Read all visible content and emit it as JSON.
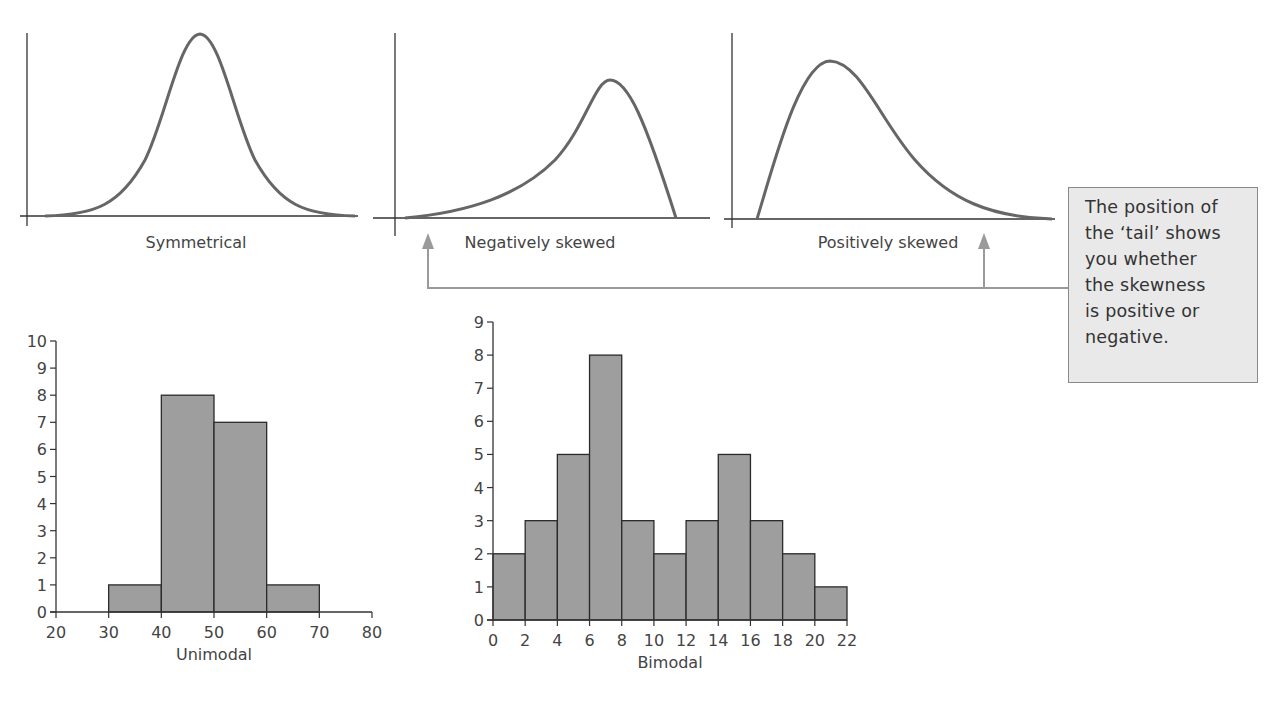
{
  "callout": {
    "lines": [
      "The position of",
      "the ‘tail’ shows",
      "you whether",
      "the skewness",
      "is positive or",
      "negative."
    ],
    "fill": "#e9e9e9",
    "border": "#8a8a8a"
  },
  "arrow_color": "#9a9a9a",
  "bar_fill": "#9e9e9e",
  "chart_data": [
    {
      "type": "line",
      "title": "Symmetrical",
      "xlabel": "Symmetrical",
      "description": "Bell-shaped symmetric distribution curve",
      "shape": "symmetric"
    },
    {
      "type": "line",
      "title": "Negatively skewed",
      "xlabel": "Negatively skewed",
      "description": "Curve with long tail to the left, peak on the right",
      "shape": "negative-skew"
    },
    {
      "type": "line",
      "title": "Positively skewed",
      "xlabel": "Positively skewed",
      "description": "Curve with long tail to the right, peak on the left",
      "shape": "positive-skew"
    },
    {
      "type": "bar",
      "title": "Unimodal",
      "xlabel": "Unimodal",
      "ylabel": "",
      "bins": [
        [
          30,
          40
        ],
        [
          40,
          50
        ],
        [
          50,
          60
        ],
        [
          60,
          70
        ]
      ],
      "values": [
        1,
        8,
        7,
        1
      ],
      "xticks": [
        20,
        30,
        40,
        50,
        60,
        70,
        80
      ],
      "yticks": [
        0,
        1,
        2,
        3,
        4,
        5,
        6,
        7,
        8,
        9,
        10
      ],
      "xlim": [
        20,
        80
      ],
      "ylim": [
        0,
        10
      ],
      "grid": false
    },
    {
      "type": "bar",
      "title": "Bimodal",
      "xlabel": "Bimodal",
      "ylabel": "",
      "bins": [
        [
          0,
          2
        ],
        [
          2,
          4
        ],
        [
          4,
          6
        ],
        [
          6,
          8
        ],
        [
          8,
          10
        ],
        [
          10,
          12
        ],
        [
          12,
          14
        ],
        [
          14,
          16
        ],
        [
          16,
          18
        ],
        [
          18,
          20
        ],
        [
          20,
          22
        ]
      ],
      "values": [
        2,
        3,
        5,
        8,
        3,
        2,
        3,
        5,
        3,
        2,
        1
      ],
      "xticks": [
        0,
        2,
        4,
        6,
        8,
        10,
        12,
        14,
        16,
        18,
        20,
        22
      ],
      "yticks": [
        0,
        1,
        2,
        3,
        4,
        5,
        6,
        7,
        8,
        9
      ],
      "xlim": [
        0,
        22
      ],
      "ylim": [
        0,
        9
      ],
      "grid": false
    }
  ]
}
